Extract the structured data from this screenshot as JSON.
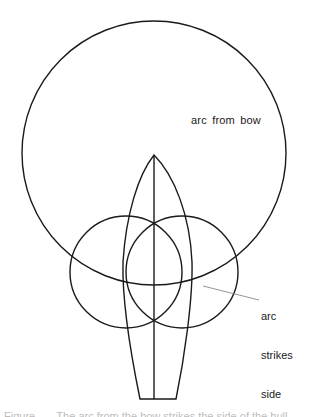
{
  "diagram": {
    "colors": {
      "stroke": "#1a1a1a",
      "leader": "#888888",
      "background": "#ffffff"
    },
    "labels": {
      "arc_from_bow": "arc from bow",
      "arc_strikes_side": [
        "arc",
        "strikes",
        "side"
      ]
    },
    "caption": "Figure . . . The arc from the bow strikes the side of the hull . . ."
  }
}
